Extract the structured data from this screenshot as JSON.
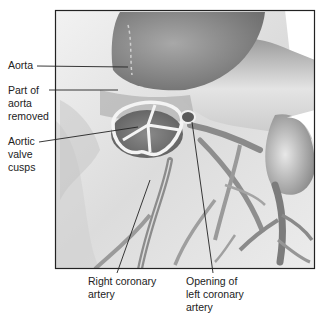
{
  "figure": {
    "frame": {
      "x": 55,
      "y": 10,
      "width": 260,
      "height": 259,
      "stroke": "#222222"
    },
    "palette": {
      "background": "#ffffff",
      "tissue_light": "#e6e6e6",
      "tissue_mid": "#b5b5b5",
      "tissue_dark": "#7a7a7a",
      "vessel": "#8c8c8c",
      "valve_rim": "#f4f4f4",
      "leader_line": "#222222"
    }
  },
  "labels": {
    "aorta": "Aorta",
    "part_removed": "Part of\naorta\nremoved",
    "cusps": "Aortic\nvalve\ncusps",
    "right_coronary": "Right coronary\nartery",
    "left_coronary": "Opening of\nleft coronary\nartery"
  },
  "icons": {
    "illustration": "heart-anatomy-illustration"
  }
}
